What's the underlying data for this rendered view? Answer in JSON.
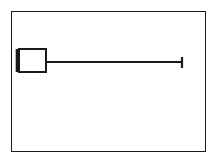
{
  "figure": {
    "type": "boxplot",
    "orientation": "horizontal",
    "title": "",
    "background_color": "#ffffff",
    "line_color": "#1a1a1a",
    "frame": {
      "visible": true,
      "border_color": "#1a1a1a",
      "border_width_px": 1.5
    }
  },
  "chart_data": {
    "type": "bar",
    "chart_subtype": "boxplot",
    "orientation": "horizontal",
    "title": "",
    "subtitle": "",
    "xlabel": "",
    "ylabel": "",
    "grid": false,
    "legend": null,
    "legend_position": "none",
    "xlim": [
      0,
      195
    ],
    "ylim": [
      0,
      141
    ],
    "xticks": [],
    "xticklabels": [],
    "yticks": [],
    "yticklabels": [],
    "categories": [
      "series-1"
    ],
    "values": [
      34
    ],
    "series": [
      {
        "name": "series-1",
        "min": 4,
        "q1": 7,
        "median": 5,
        "q3": 34,
        "max": 170,
        "lower_whisker": 7,
        "upper_whisker": 170,
        "outliers": [],
        "box_center_y": 50,
        "box_half_height": 12
      }
    ],
    "annotations": []
  },
  "geometry": {
    "box": {
      "x": 7,
      "y": 37,
      "width": 27,
      "height": 23
    },
    "median_line": {
      "x": 5,
      "y1": 37,
      "y2": 60
    },
    "whisker_line": {
      "x1": 34,
      "x2": 170,
      "y": 50
    },
    "whisker_cap": {
      "x": 170,
      "y1": 45,
      "y2": 56
    }
  },
  "elements": {
    "frame_label": "plot frame",
    "box_label": "interquartile range box",
    "median_label": "median line",
    "whisker_label": "upper whisker",
    "cap_label": "upper whisker cap"
  }
}
